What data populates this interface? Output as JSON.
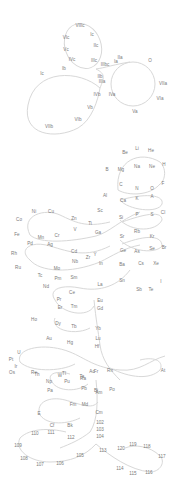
{
  "diagram": {
    "colors": {
      "line": "#d8d8d8",
      "text": "#7a7a7a",
      "background": "#ffffff"
    },
    "labels": [
      {
        "text": "VIIIc",
        "g": "g1"
      },
      {
        "text": "Ic",
        "g": "g1"
      },
      {
        "text": "VIc",
        "g": "g1"
      },
      {
        "text": "IIc",
        "g": "g1"
      },
      {
        "text": "Vc",
        "g": "g1"
      },
      {
        "text": "IVc",
        "g": "g1"
      },
      {
        "text": "IIIc",
        "g": "g1"
      },
      {
        "text": "IIIbc",
        "g": "g1"
      },
      {
        "text": "Ia",
        "g": "g1"
      },
      {
        "text": "Ib",
        "g": "g1"
      },
      {
        "text": "IIa",
        "g": "g1"
      },
      {
        "text": "O",
        "g": "g1"
      },
      {
        "text": "Ic",
        "g": "g1"
      },
      {
        "text": "IIb",
        "g": "g1"
      },
      {
        "text": "IIIa",
        "g": "g1"
      },
      {
        "text": "VIIa",
        "g": "g1"
      },
      {
        "text": "IVb",
        "g": "g1"
      },
      {
        "text": "IVa",
        "g": "g1"
      },
      {
        "text": "VIa",
        "g": "g1"
      },
      {
        "text": "Vb",
        "g": "g1"
      },
      {
        "text": "Va",
        "g": "g1"
      },
      {
        "text": "VIb",
        "g": "g1"
      },
      {
        "text": "VIIb",
        "g": "g1"
      },
      {
        "text": "Be",
        "g": "g2"
      },
      {
        "text": "Li",
        "g": "g2"
      },
      {
        "text": "He",
        "g": "g2"
      },
      {
        "text": "H",
        "g": "g2"
      },
      {
        "text": "B",
        "g": "g2"
      },
      {
        "text": "Mg",
        "g": "g2"
      },
      {
        "text": "Na",
        "g": "g2"
      },
      {
        "text": "Ne",
        "g": "g2"
      },
      {
        "text": "C",
        "g": "g2"
      },
      {
        "text": "N",
        "g": "g2"
      },
      {
        "text": "O",
        "g": "g2"
      },
      {
        "text": "F",
        "g": "g2"
      },
      {
        "text": "Al",
        "g": "g2"
      },
      {
        "text": "Ca",
        "g": "g2"
      },
      {
        "text": "K",
        "g": "g2"
      },
      {
        "text": "A",
        "g": "g2"
      },
      {
        "text": "Si",
        "g": "g2"
      },
      {
        "text": "P",
        "g": "g2"
      },
      {
        "text": "S",
        "g": "g2"
      },
      {
        "text": "Cl",
        "g": "g2"
      },
      {
        "text": "Sr",
        "g": "g2"
      },
      {
        "text": "Rb",
        "g": "g2"
      },
      {
        "text": "Kr",
        "g": "g2"
      },
      {
        "text": "Ge",
        "g": "g2"
      },
      {
        "text": "As",
        "g": "g2"
      },
      {
        "text": "Se",
        "g": "g2"
      },
      {
        "text": "Br",
        "g": "g2"
      },
      {
        "text": "Ni",
        "g": "g3"
      },
      {
        "text": "Cu",
        "g": "g3"
      },
      {
        "text": "Co",
        "g": "g3"
      },
      {
        "text": "Zn",
        "g": "g3"
      },
      {
        "text": "Sc",
        "g": "g3"
      },
      {
        "text": "Ti",
        "g": "g3"
      },
      {
        "text": "Fe",
        "g": "g3"
      },
      {
        "text": "Mn",
        "g": "g3"
      },
      {
        "text": "Cr",
        "g": "g3"
      },
      {
        "text": "V",
        "g": "g3"
      },
      {
        "text": "Ga",
        "g": "g3"
      },
      {
        "text": "Pd",
        "g": "g3"
      },
      {
        "text": "Ag",
        "g": "g3"
      },
      {
        "text": "Cd",
        "g": "g3"
      },
      {
        "text": "Y",
        "g": "g3"
      },
      {
        "text": "Zr",
        "g": "g3"
      },
      {
        "text": "Rh",
        "g": "g3"
      },
      {
        "text": "Nb",
        "g": "g3"
      },
      {
        "text": "In",
        "g": "g3"
      },
      {
        "text": "Ru",
        "g": "g3"
      },
      {
        "text": "Mo",
        "g": "g3"
      },
      {
        "text": "Tc",
        "g": "g3"
      },
      {
        "text": "Ba",
        "g": "g4"
      },
      {
        "text": "Cs",
        "g": "g4"
      },
      {
        "text": "Xe",
        "g": "g4"
      },
      {
        "text": "I",
        "g": "g4"
      },
      {
        "text": "Sn",
        "g": "g4"
      },
      {
        "text": "Sb",
        "g": "g4"
      },
      {
        "text": "Te",
        "g": "g4"
      },
      {
        "text": "Pm",
        "g": "g5"
      },
      {
        "text": "Sm",
        "g": "g5"
      },
      {
        "text": "La",
        "g": "g5"
      },
      {
        "text": "Nd",
        "g": "g5"
      },
      {
        "text": "Ce",
        "g": "g5"
      },
      {
        "text": "Pr",
        "g": "g5"
      },
      {
        "text": "Eu",
        "g": "g5"
      },
      {
        "text": "Er",
        "g": "g5"
      },
      {
        "text": "Tm",
        "g": "g5"
      },
      {
        "text": "Gd",
        "g": "g5"
      },
      {
        "text": "Ho",
        "g": "g5"
      },
      {
        "text": "Dy",
        "g": "g5"
      },
      {
        "text": "Tb",
        "g": "g5"
      },
      {
        "text": "Yb",
        "g": "g5"
      },
      {
        "text": "Lu",
        "g": "g5"
      },
      {
        "text": "Hf",
        "g": "g5"
      },
      {
        "text": "Au",
        "g": "g5"
      },
      {
        "text": "Hg",
        "g": "g5"
      },
      {
        "text": "Pt",
        "g": "g5"
      },
      {
        "text": "Ir",
        "g": "g5"
      },
      {
        "text": "Os",
        "g": "g5"
      },
      {
        "text": "Re",
        "g": "g5"
      },
      {
        "text": "W",
        "g": "g5"
      },
      {
        "text": "Ta",
        "g": "g5"
      },
      {
        "text": "Tl",
        "g": "g5"
      },
      {
        "text": "Ra",
        "g": "g6"
      },
      {
        "text": "Fr",
        "g": "g6"
      },
      {
        "text": "Rn",
        "g": "g6"
      },
      {
        "text": "At",
        "g": "g6"
      },
      {
        "text": "Pb",
        "g": "g6"
      },
      {
        "text": "Bi",
        "g": "g6"
      },
      {
        "text": "Po",
        "g": "g6"
      },
      {
        "text": "Np",
        "g": "g7"
      },
      {
        "text": "Pu",
        "g": "g7"
      },
      {
        "text": "U",
        "g": "g7"
      },
      {
        "text": "Ac",
        "g": "g7"
      },
      {
        "text": "Pa",
        "g": "g7"
      },
      {
        "text": "Th",
        "g": "g7"
      },
      {
        "text": "Am",
        "g": "g7"
      },
      {
        "text": "Fm",
        "g": "g7"
      },
      {
        "text": "Md",
        "g": "g7"
      },
      {
        "text": "Cm",
        "g": "g7"
      },
      {
        "text": "E",
        "g": "g7"
      },
      {
        "text": "Cf",
        "g": "g7"
      },
      {
        "text": "Bk",
        "g": "g7"
      },
      {
        "text": "102",
        "g": "g7"
      },
      {
        "text": "103",
        "g": "g7"
      },
      {
        "text": "104",
        "g": "g7"
      },
      {
        "text": "110",
        "g": "g8"
      },
      {
        "text": "111",
        "g": "g8"
      },
      {
        "text": "112",
        "g": "g8"
      },
      {
        "text": "109",
        "g": "g8"
      },
      {
        "text": "108",
        "g": "g8"
      },
      {
        "text": "107",
        "g": "g8"
      },
      {
        "text": "106",
        "g": "g8"
      },
      {
        "text": "105",
        "g": "g8"
      },
      {
        "text": "113",
        "g": "g8"
      },
      {
        "text": "120",
        "g": "g8"
      },
      {
        "text": "119",
        "g": "g8"
      },
      {
        "text": "118",
        "g": "g8"
      },
      {
        "text": "117",
        "g": "g8"
      },
      {
        "text": "114",
        "g": "g8"
      },
      {
        "text": "115",
        "g": "g8"
      },
      {
        "text": "116",
        "g": "g8"
      }
    ]
  }
}
